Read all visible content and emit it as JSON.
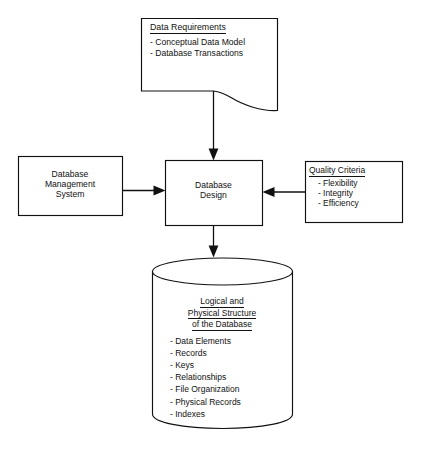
{
  "diagram": {
    "colors": {
      "stroke": "#111111",
      "background": "#ffffff",
      "text": "#111111"
    },
    "document_node": {
      "shape": "document",
      "title": "Data Requirements",
      "items": [
        "- Conceptual Data Model",
        "- Database Transactions"
      ]
    },
    "input_node": {
      "shape": "rectangle",
      "lines": [
        "Database",
        "Management",
        "System"
      ]
    },
    "process_node": {
      "shape": "rectangle",
      "lines": [
        "Database",
        "Design"
      ]
    },
    "criteria_node": {
      "shape": "rectangle",
      "title": "Quality Criteria",
      "items": [
        "- Flexibility",
        "- Integrity",
        "- Efficiency"
      ]
    },
    "output_node": {
      "shape": "cylinder",
      "heading_lines": [
        "Logical and",
        "Physical Structure",
        "of the Database"
      ],
      "items": [
        "- Data Elements",
        "- Records",
        "- Keys",
        "- Relationships",
        "- File Organization",
        "- Physical Records",
        "- Indexes"
      ]
    },
    "connectors": [
      {
        "name": "document-to-design",
        "direction": "down"
      },
      {
        "name": "dbms-to-design",
        "direction": "right"
      },
      {
        "name": "criteria-to-design",
        "direction": "left"
      },
      {
        "name": "design-to-database",
        "direction": "down"
      }
    ]
  }
}
